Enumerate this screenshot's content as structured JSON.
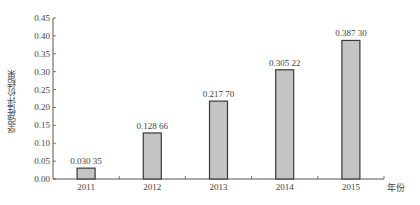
{
  "chart_data": {
    "type": "bar",
    "title": "",
    "xlabel": "年份",
    "ylabel": "坚强性评价结果",
    "categories": [
      "2011",
      "2012",
      "2013",
      "2014",
      "2015"
    ],
    "values": [
      0.03035,
      0.12866,
      0.2177,
      0.30522,
      0.3873
    ],
    "value_labels": [
      "0.030 35",
      "0.128 66",
      "0.217 70",
      "0.305 22",
      "0.387 30"
    ],
    "ylim": [
      0,
      0.45
    ],
    "yticks": [
      "0.00",
      "0.05",
      "0.10",
      "0.15",
      "0.20",
      "0.25",
      "0.30",
      "0.35",
      "0.40",
      "0.45"
    ],
    "grid": false,
    "legend": null,
    "colors": {
      "bar_fill": "#c4c4c4",
      "bar_stroke": "#3a3a3a",
      "axis": "#555555"
    }
  }
}
